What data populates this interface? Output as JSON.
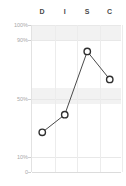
{
  "chart_data": {
    "type": "line",
    "title": "",
    "subtitle": "",
    "xlabel": "",
    "ylabel": "",
    "categories": [
      "D",
      "I",
      "S",
      "C"
    ],
    "values": [
      27,
      39,
      82,
      63
    ],
    "series": [
      {
        "name": "DISC profile",
        "values": [
          27,
          39,
          82,
          63
        ]
      }
    ],
    "ylim": [
      0,
      100
    ],
    "y_ticks": [
      {
        "label": "100%",
        "value": 100
      },
      {
        "label": "90%",
        "value": 90
      },
      {
        "label": "50%",
        "value": 50
      },
      {
        "label": "10%",
        "value": 10
      },
      {
        "label": "0",
        "value": 0
      }
    ],
    "bands": [
      {
        "from": 90,
        "to": 100
      },
      {
        "from": 46,
        "to": 57
      }
    ],
    "grid": true,
    "grid_vertical": true,
    "legend": "none",
    "marker": "circle-open",
    "colors": {
      "line": "#4a4a4a",
      "marker_stroke": "#2f2f2f",
      "marker_fill": "#ffffff",
      "grid": "#ececec",
      "band": "#f2f2f2",
      "axis_label": "#a8a8a8",
      "header_label": "#4a4a4a",
      "background": "#ffffff"
    }
  },
  "header": {
    "labels": [
      "D",
      "I",
      "S",
      "C"
    ]
  }
}
